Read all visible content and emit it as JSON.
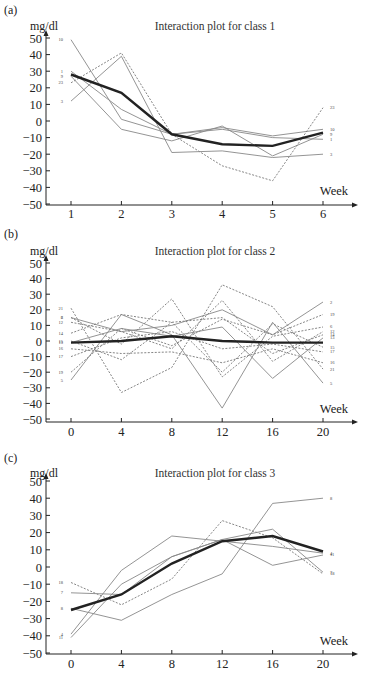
{
  "chart_data": [
    {
      "type": "line",
      "panel": "(a)",
      "title": "Interaction plot for class 1",
      "ylabel": "mg/dl",
      "xlabel": "Week",
      "ylim": [
        -50,
        50
      ],
      "yticks": [
        50,
        40,
        30,
        20,
        10,
        0,
        -10,
        -20,
        -30,
        -40,
        -50
      ],
      "x": [
        1,
        2,
        3,
        4,
        5,
        6
      ],
      "xticks": [
        "1",
        "2",
        "3",
        "4",
        "5",
        "6"
      ],
      "grid": false,
      "series": [
        {
          "name": "10",
          "style": "solid",
          "values": [
            49,
            1,
            -8,
            -4,
            -9,
            -5
          ]
        },
        {
          "name": "1",
          "style": "solid",
          "values": [
            30,
            7,
            -8,
            -5,
            -10,
            -11
          ]
        },
        {
          "name": "9",
          "style": "solid",
          "values": [
            27,
            -5,
            -12,
            -3,
            -21,
            -8
          ]
        },
        {
          "name": "23",
          "style": "dashed",
          "values": [
            23,
            41,
            -8,
            -27,
            -36,
            8
          ]
        },
        {
          "name": "3",
          "style": "solid",
          "values": [
            12,
            39,
            -19,
            -18,
            -22,
            -20
          ]
        },
        {
          "name": "mean",
          "style": "bold",
          "values": [
            28,
            17,
            -8,
            -14,
            -15,
            -7
          ]
        }
      ]
    },
    {
      "type": "line",
      "panel": "(b)",
      "title": "Interaction plot for class 2",
      "ylabel": "mg/dl",
      "xlabel": "Week",
      "ylim": [
        -50,
        50
      ],
      "yticks": [
        50,
        40,
        30,
        20,
        10,
        0,
        -10,
        -20,
        -30,
        -40,
        -50
      ],
      "x": [
        0,
        4,
        8,
        12,
        16,
        20
      ],
      "xticks": [
        "0",
        "4",
        "8",
        "12",
        "16",
        "20"
      ],
      "grid": false,
      "left_labels": [
        "21",
        "6",
        "12",
        "14",
        "13",
        "15",
        "20",
        "22",
        "25",
        "24",
        "26",
        "17",
        "19",
        "5"
      ],
      "right_labels": [
        "2",
        "19",
        "24",
        "12",
        "22",
        "6",
        "20",
        "13",
        "14",
        "17",
        "15",
        "16",
        "21",
        "5"
      ],
      "series": [
        {
          "name": "2",
          "style": "solid",
          "values": [
            15,
            6,
            10,
            20,
            4,
            25
          ]
        },
        {
          "name": "5",
          "style": "solid",
          "values": [
            -25,
            17,
            4,
            -43,
            12,
            -27
          ]
        },
        {
          "name": "21",
          "style": "dashed",
          "values": [
            21,
            -33,
            -17,
            36,
            22,
            -18
          ]
        },
        {
          "name": "6",
          "style": "dashed",
          "values": [
            15,
            -2,
            27,
            -23,
            3,
            9
          ]
        },
        {
          "name": "12",
          "style": "dashed",
          "values": [
            12,
            6,
            -5,
            26,
            -13,
            6
          ]
        },
        {
          "name": "14",
          "style": "dashed",
          "values": [
            5,
            17,
            12,
            15,
            -8,
            4
          ]
        },
        {
          "name": "13",
          "style": "solid",
          "values": [
            -1,
            8,
            3,
            9,
            -24,
            2
          ]
        },
        {
          "name": "15",
          "style": "dashed",
          "values": [
            0,
            -12,
            12,
            -20,
            11,
            -4
          ]
        },
        {
          "name": "19",
          "style": "dashed",
          "values": [
            -20,
            8,
            -3,
            14,
            4,
            17
          ]
        },
        {
          "name": "16",
          "style": "dashed",
          "values": [
            -5,
            -8,
            -7,
            -14,
            -5,
            -14
          ]
        },
        {
          "name": "17",
          "style": "dashed",
          "values": [
            -10,
            2,
            6,
            -5,
            -2,
            -7
          ]
        },
        {
          "name": "mean",
          "style": "bold",
          "values": [
            -1,
            0,
            3,
            0,
            -1,
            -1
          ]
        }
      ]
    },
    {
      "type": "line",
      "panel": "(c)",
      "title": "Interaction plot for class 3",
      "ylabel": "mg/dl",
      "xlabel": "Week",
      "ylim": [
        -50,
        50
      ],
      "yticks": [
        50,
        40,
        30,
        20,
        10,
        0,
        -10,
        -20,
        -30,
        -40,
        -50
      ],
      "x": [
        0,
        4,
        8,
        12,
        16,
        20
      ],
      "xticks": [
        "0",
        "4",
        "8",
        "12",
        "16",
        "20"
      ],
      "grid": false,
      "series": [
        {
          "name": "18",
          "style": "dashed",
          "values": [
            -9,
            -22,
            -7,
            27,
            17,
            -4
          ]
        },
        {
          "name": "7",
          "style": "solid",
          "values": [
            -15,
            -16,
            6,
            16,
            22,
            -3
          ]
        },
        {
          "name": "8",
          "style": "solid",
          "values": [
            -24,
            -31,
            -16,
            -4,
            37,
            40
          ]
        },
        {
          "name": "4",
          "style": "solid",
          "values": [
            -39,
            -2,
            18,
            15,
            12,
            8
          ]
        },
        {
          "name": "11",
          "style": "solid",
          "values": [
            -41,
            -10,
            6,
            16,
            1,
            7
          ]
        },
        {
          "name": "mean",
          "style": "bold",
          "values": [
            -25,
            -16,
            2,
            15,
            18,
            9
          ]
        }
      ]
    }
  ]
}
